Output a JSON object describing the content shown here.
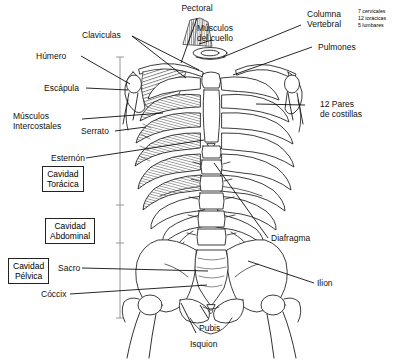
{
  "diagram": {
    "labels": {
      "pectoral": "Pectoral",
      "claviculas": "Claviculas",
      "musculos_cuello": "Músculos\ndel cuello",
      "columna_vertebral": "Columna\nVertebral",
      "pulmones": "Pulmones",
      "humero": "Húmero",
      "escapula": "Escápula",
      "musculos_intercostales": "Músculos\nIntercostales",
      "serrato": "Serrato",
      "esternon": "Esternón",
      "pares_costillas": "12 Pares\nde costillas",
      "diafragma": "Diafragma",
      "ilion": "Ilion",
      "sacro": "Sacro",
      "coccix": "Cóccix",
      "pubis": "Pubis",
      "isquion": "Isquion"
    },
    "vertebrae_counts": {
      "cervicales": "7 cervicales",
      "toracicas": "12 torácicas",
      "lumbares": "5 lumbares"
    },
    "cavities": [
      {
        "name": "cavidad-toracica",
        "label": "Cavidad\nTorácica"
      },
      {
        "name": "cavidad-abdominal",
        "label": "Cavidad\nAbdominal"
      },
      {
        "name": "cavidad-pelvica",
        "label": "Cavidad\nPélvica"
      }
    ],
    "colors": {
      "ink": "#1a1a1a",
      "leader": "#000000",
      "bone_fill": "#ffffff",
      "background": "#ffffff",
      "bracket": "#888888"
    }
  }
}
